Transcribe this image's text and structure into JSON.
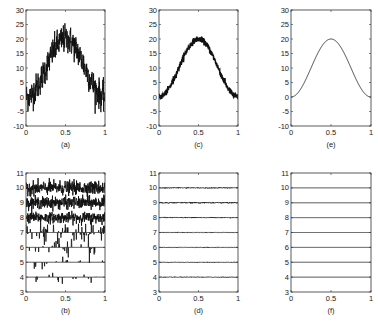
{
  "figure": {
    "panels_layout": "2 rows x 3 columns",
    "captions": [
      "(a)",
      "(c)",
      "(e)",
      "(b)",
      "(d)",
      "(f)"
    ]
  },
  "chart_data": [
    {
      "id": "a",
      "caption": "(a)",
      "type": "line",
      "description": "Noisy sinusoid-like bump (heavy noise)",
      "xlim": [
        0,
        1
      ],
      "ylim": [
        -10,
        30
      ],
      "xticks": [
        0,
        0.5,
        1
      ],
      "xtick_labels": [
        "0",
        "0.5",
        "1"
      ],
      "yticks": [
        -10,
        -5,
        0,
        5,
        10,
        15,
        20,
        25,
        30
      ],
      "ytick_labels": [
        "-10",
        "-5",
        "0",
        "5",
        "10",
        "15",
        "20",
        "25",
        "30"
      ],
      "grid": false,
      "series": [
        {
          "name": "noisy signal",
          "baseline": "10*(1-cos(2*pi*x))",
          "peak": 20,
          "noise_amplitude": 2.5
        }
      ]
    },
    {
      "id": "c",
      "caption": "(c)",
      "type": "line",
      "description": "Slightly noisy sinusoid-like bump (denoised)",
      "xlim": [
        0,
        1
      ],
      "ylim": [
        -10,
        30
      ],
      "xticks": [
        0,
        0.5,
        1
      ],
      "xtick_labels": [
        "0",
        "0.5",
        "1"
      ],
      "yticks": [
        -10,
        -5,
        0,
        5,
        10,
        15,
        20,
        25,
        30
      ],
      "ytick_labels": [
        "-10",
        "-5",
        "0",
        "5",
        "10",
        "15",
        "20",
        "25",
        "30"
      ],
      "grid": false,
      "series": [
        {
          "name": "denoised signal",
          "baseline": "10*(1-cos(2*pi*x))",
          "peak": 20,
          "noise_amplitude": 0.5
        }
      ]
    },
    {
      "id": "e",
      "caption": "(e)",
      "type": "line",
      "description": "Clean sinusoid-like bump",
      "xlim": [
        0,
        1
      ],
      "ylim": [
        -10,
        30
      ],
      "xticks": [
        0,
        0.5,
        1
      ],
      "xtick_labels": [
        "0",
        "0.5",
        "1"
      ],
      "yticks": [
        -10,
        -5,
        0,
        5,
        10,
        15,
        20,
        25,
        30
      ],
      "ytick_labels": [
        "-10",
        "-5",
        "0",
        "5",
        "10",
        "15",
        "20",
        "25",
        "30"
      ],
      "grid": false,
      "series": [
        {
          "name": "clean signal",
          "baseline": "10*(1-cos(2*pi*x))",
          "peak": 20,
          "noise_amplitude": 0
        }
      ]
    },
    {
      "id": "b",
      "caption": "(b)",
      "type": "line",
      "description": "Wavelet coefficients per level, offset by level (noisy)",
      "xlim": [
        0,
        1
      ],
      "ylim": [
        3,
        11
      ],
      "xticks": [
        0,
        0.5,
        1
      ],
      "xtick_labels": [
        "0",
        "0.5",
        "1"
      ],
      "yticks": [
        3,
        4,
        5,
        6,
        7,
        8,
        9,
        10,
        11
      ],
      "ytick_labels": [
        "3",
        "4",
        "5",
        "6",
        "7",
        "8",
        "9",
        "10",
        "11"
      ],
      "grid": false,
      "levels": [
        4,
        5,
        6,
        7,
        8,
        9,
        10
      ],
      "level_noise_amplitude": [
        0.15,
        0.2,
        0.3,
        0.3,
        0.35,
        0.4,
        0.45
      ],
      "level_density": [
        0.1,
        0.15,
        0.25,
        0.5,
        0.9,
        1,
        1
      ]
    },
    {
      "id": "d",
      "caption": "(d)",
      "type": "line",
      "description": "Thresholded wavelet coefficients per level (nearly flat)",
      "xlim": [
        0,
        1
      ],
      "ylim": [
        3,
        11
      ],
      "xticks": [
        0,
        0.5,
        1
      ],
      "xtick_labels": [
        "0",
        "0.5",
        "1"
      ],
      "yticks": [
        3,
        4,
        5,
        6,
        7,
        8,
        9,
        10,
        11
      ],
      "ytick_labels": [
        "3",
        "4",
        "5",
        "6",
        "7",
        "8",
        "9",
        "10",
        "11"
      ],
      "grid": false,
      "levels": [
        4,
        5,
        6,
        7,
        8,
        9,
        10
      ],
      "level_noise_amplitude": [
        0.02,
        0.02,
        0.02,
        0.02,
        0.03,
        0.04,
        0.03
      ]
    },
    {
      "id": "f",
      "caption": "(f)",
      "type": "line",
      "description": "True wavelet coefficients per level (flat)",
      "xlim": [
        0,
        1
      ],
      "ylim": [
        3,
        11
      ],
      "xticks": [
        0,
        0.5,
        1
      ],
      "xtick_labels": [
        "0",
        "0.5",
        "1"
      ],
      "yticks": [
        3,
        4,
        5,
        6,
        7,
        8,
        9,
        10,
        11
      ],
      "ytick_labels": [
        "3",
        "4",
        "5",
        "6",
        "7",
        "8",
        "9",
        "10",
        "11"
      ],
      "grid": false,
      "levels": [
        4,
        5,
        6,
        7,
        8,
        9,
        10
      ],
      "level_noise_amplitude": [
        0,
        0,
        0,
        0,
        0,
        0,
        0
      ]
    }
  ]
}
